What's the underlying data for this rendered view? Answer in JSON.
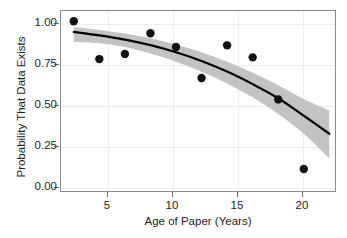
{
  "chart_data": {
    "type": "scatter",
    "title": "",
    "xlabel": "Age of Paper (Years)",
    "ylabel": "Probability That Data Exists",
    "xlim": [
      1,
      22.6
    ],
    "ylim": [
      0.0,
      1.06
    ],
    "grid": true,
    "legend": null,
    "xticks": [
      5,
      10,
      15,
      20
    ],
    "xtick_labels": [
      "5",
      "10",
      "15",
      "20"
    ],
    "yticks": [
      0.0,
      0.25,
      0.5,
      0.75,
      1.0
    ],
    "ytick_labels": [
      "0.00",
      "0.25",
      "0.50",
      "0.75",
      "1.00"
    ],
    "points": {
      "name": "Observed proportion",
      "x": [
        2,
        4,
        6,
        8,
        10,
        12,
        14,
        16,
        18,
        20
      ],
      "y": [
        1.0,
        0.78,
        0.81,
        0.93,
        0.85,
        0.67,
        0.86,
        0.79,
        0.545,
        0.14
      ],
      "marker": "circle",
      "color": "#111111",
      "size": 4.2
    },
    "fit_line": {
      "name": "Logistic fit",
      "x": [
        2,
        4,
        6,
        8,
        10,
        12,
        14,
        16,
        18,
        20,
        22
      ],
      "y": [
        0.938,
        0.918,
        0.893,
        0.861,
        0.82,
        0.769,
        0.707,
        0.634,
        0.552,
        0.45,
        0.345
      ],
      "color": "#000000",
      "width": 2.2
    },
    "confidence_band": {
      "name": "95% confidence interval",
      "x": [
        2,
        4,
        6,
        8,
        10,
        12,
        14,
        16,
        18,
        20,
        22
      ],
      "upper": [
        0.967,
        0.95,
        0.929,
        0.901,
        0.865,
        0.82,
        0.764,
        0.7,
        0.628,
        0.548,
        0.48
      ],
      "lower": [
        0.88,
        0.872,
        0.85,
        0.812,
        0.765,
        0.706,
        0.638,
        0.557,
        0.46,
        0.345,
        0.202
      ],
      "color": "#c3c3c3",
      "opacity": 1
    }
  }
}
